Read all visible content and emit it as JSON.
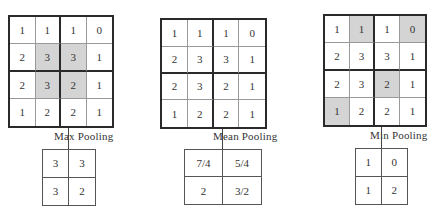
{
  "input_grid": [
    [
      "1",
      "1",
      "1",
      "0"
    ],
    [
      "2",
      "3",
      "3",
      "1"
    ],
    [
      "2",
      "3",
      "2",
      "1"
    ],
    [
      "1",
      "2",
      "2",
      "1"
    ]
  ],
  "panels": [
    {
      "id": "max",
      "label": "Max Pooling",
      "shaded_cells": [
        [
          1,
          1
        ],
        [
          1,
          2
        ],
        [
          2,
          1
        ],
        [
          2,
          2
        ]
      ],
      "output_grid": [
        [
          "3",
          "3"
        ],
        [
          "3",
          "2"
        ]
      ]
    },
    {
      "id": "mean",
      "label": "Mean Pooling",
      "shaded_cells": [],
      "output_grid": [
        [
          "7/4",
          "5/4"
        ],
        [
          "2",
          "3/2"
        ]
      ]
    },
    {
      "id": "min",
      "label": "Min Pooling",
      "shaded_cells": [
        [
          0,
          1
        ],
        [
          0,
          3
        ],
        [
          2,
          2
        ],
        [
          3,
          0
        ]
      ],
      "output_grid": [
        [
          "1",
          "0"
        ],
        [
          "1",
          "2"
        ]
      ]
    }
  ],
  "colors": {
    "shade": "#d4d4d4",
    "border": "#2a2a2a"
  }
}
